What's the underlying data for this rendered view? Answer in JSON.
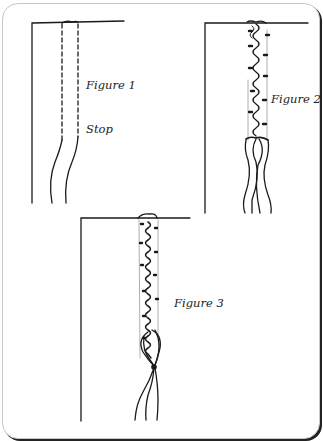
{
  "figures": [
    {
      "id": "figure-1",
      "label": "Figure 1",
      "annotation": "Stop"
    },
    {
      "id": "figure-2",
      "label": "Figure 2"
    },
    {
      "id": "figure-3",
      "label": "Figure 3"
    }
  ],
  "colors": {
    "ink": "#1a1a1a",
    "frame": "#c8c8c8",
    "shadow": "#222222"
  }
}
